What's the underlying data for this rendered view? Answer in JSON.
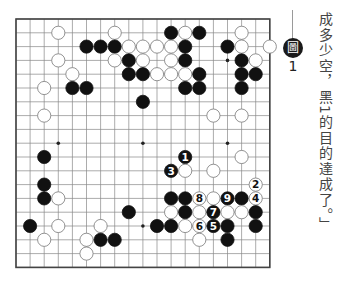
{
  "diagram": {
    "type": "go-board",
    "size": 19,
    "colors": {
      "black": "#111111",
      "white": "#ffffff",
      "line": "#888888",
      "frame": "#444444"
    },
    "star_points": [
      [
        3,
        3
      ],
      [
        9,
        3
      ],
      [
        15,
        3
      ],
      [
        3,
        9
      ],
      [
        9,
        9
      ],
      [
        15,
        9
      ],
      [
        3,
        15
      ],
      [
        9,
        15
      ],
      [
        15,
        15
      ]
    ],
    "stones": [
      {
        "c": 3,
        "r": 1,
        "color": "W"
      },
      {
        "c": 7,
        "r": 1,
        "color": "W"
      },
      {
        "c": 11,
        "r": 1,
        "color": "B"
      },
      {
        "c": 12,
        "r": 1,
        "color": "W"
      },
      {
        "c": 13,
        "r": 1,
        "color": "B"
      },
      {
        "c": 16,
        "r": 1,
        "color": "W"
      },
      {
        "c": 5,
        "r": 2,
        "color": "B"
      },
      {
        "c": 6,
        "r": 2,
        "color": "B"
      },
      {
        "c": 7,
        "r": 2,
        "color": "B"
      },
      {
        "c": 8,
        "r": 2,
        "color": "W"
      },
      {
        "c": 9,
        "r": 2,
        "color": "W"
      },
      {
        "c": 10,
        "r": 2,
        "color": "W"
      },
      {
        "c": 11,
        "r": 2,
        "color": "W"
      },
      {
        "c": 12,
        "r": 2,
        "color": "B"
      },
      {
        "c": 15,
        "r": 2,
        "color": "B"
      },
      {
        "c": 16,
        "r": 2,
        "color": "W"
      },
      {
        "c": 18,
        "r": 2,
        "color": "W"
      },
      {
        "c": 3,
        "r": 3,
        "color": "W"
      },
      {
        "c": 7,
        "r": 3,
        "color": "W"
      },
      {
        "c": 8,
        "r": 3,
        "color": "B"
      },
      {
        "c": 9,
        "r": 3,
        "color": "W"
      },
      {
        "c": 11,
        "r": 3,
        "color": "W"
      },
      {
        "c": 12,
        "r": 3,
        "color": "B"
      },
      {
        "c": 16,
        "r": 3,
        "color": "B"
      },
      {
        "c": 17,
        "r": 3,
        "color": "W"
      },
      {
        "c": 4,
        "r": 4,
        "color": "W"
      },
      {
        "c": 8,
        "r": 4,
        "color": "B"
      },
      {
        "c": 9,
        "r": 4,
        "color": "B"
      },
      {
        "c": 10,
        "r": 4,
        "color": "W"
      },
      {
        "c": 11,
        "r": 4,
        "color": "W"
      },
      {
        "c": 12,
        "r": 4,
        "color": "W"
      },
      {
        "c": 13,
        "r": 4,
        "color": "B"
      },
      {
        "c": 16,
        "r": 4,
        "color": "B"
      },
      {
        "c": 17,
        "r": 4,
        "color": "B"
      },
      {
        "c": 2,
        "r": 5,
        "color": "W"
      },
      {
        "c": 4,
        "r": 5,
        "color": "B"
      },
      {
        "c": 5,
        "r": 5,
        "color": "B"
      },
      {
        "c": 12,
        "r": 5,
        "color": "B"
      },
      {
        "c": 13,
        "r": 5,
        "color": "B"
      },
      {
        "c": 16,
        "r": 5,
        "color": "B"
      },
      {
        "c": 9,
        "r": 6,
        "color": "B"
      },
      {
        "c": 2,
        "r": 7,
        "color": "W"
      },
      {
        "c": 14,
        "r": 7,
        "color": "W"
      },
      {
        "c": 16,
        "r": 7,
        "color": "W"
      },
      {
        "c": 2,
        "r": 10,
        "color": "B"
      },
      {
        "c": 12,
        "r": 10,
        "color": "B",
        "label": "1"
      },
      {
        "c": 16,
        "r": 10,
        "color": "W"
      },
      {
        "c": 11,
        "r": 11,
        "color": "B",
        "label": "3"
      },
      {
        "c": 12,
        "r": 11,
        "color": "W"
      },
      {
        "c": 14,
        "r": 11,
        "color": "W"
      },
      {
        "c": 2,
        "r": 12,
        "color": "B"
      },
      {
        "c": 17,
        "r": 12,
        "color": "W",
        "label": "2"
      },
      {
        "c": 2,
        "r": 13,
        "color": "B"
      },
      {
        "c": 3,
        "r": 13,
        "color": "W"
      },
      {
        "c": 11,
        "r": 13,
        "color": "B"
      },
      {
        "c": 12,
        "r": 13,
        "color": "B"
      },
      {
        "c": 13,
        "r": 13,
        "color": "W",
        "label": "8"
      },
      {
        "c": 14,
        "r": 13,
        "color": "W"
      },
      {
        "c": 15,
        "r": 13,
        "color": "B",
        "label": "9"
      },
      {
        "c": 16,
        "r": 13,
        "color": "B"
      },
      {
        "c": 17,
        "r": 13,
        "color": "W",
        "label": "4"
      },
      {
        "c": 8,
        "r": 14,
        "color": "B"
      },
      {
        "c": 11,
        "r": 14,
        "color": "W"
      },
      {
        "c": 12,
        "r": 14,
        "color": "B"
      },
      {
        "c": 13,
        "r": 14,
        "color": "W"
      },
      {
        "c": 14,
        "r": 14,
        "color": "B",
        "label": "7"
      },
      {
        "c": 15,
        "r": 14,
        "color": "W"
      },
      {
        "c": 16,
        "r": 14,
        "color": "W"
      },
      {
        "c": 17,
        "r": 14,
        "color": "B"
      },
      {
        "c": 1,
        "r": 15,
        "color": "B"
      },
      {
        "c": 3,
        "r": 15,
        "color": "W"
      },
      {
        "c": 6,
        "r": 15,
        "color": "W"
      },
      {
        "c": 10,
        "r": 15,
        "color": "B"
      },
      {
        "c": 11,
        "r": 15,
        "color": "B"
      },
      {
        "c": 12,
        "r": 15,
        "color": "W"
      },
      {
        "c": 13,
        "r": 15,
        "color": "W",
        "label": "6"
      },
      {
        "c": 14,
        "r": 15,
        "color": "B",
        "label": "5"
      },
      {
        "c": 15,
        "r": 15,
        "color": "B"
      },
      {
        "c": 17,
        "r": 15,
        "color": "B"
      },
      {
        "c": 2,
        "r": 16,
        "color": "W"
      },
      {
        "c": 5,
        "r": 16,
        "color": "W"
      },
      {
        "c": 6,
        "r": 16,
        "color": "B"
      },
      {
        "c": 7,
        "r": 16,
        "color": "B"
      },
      {
        "c": 13,
        "r": 16,
        "color": "W"
      },
      {
        "c": 15,
        "r": 16,
        "color": "B"
      },
      {
        "c": 5,
        "r": 17,
        "color": "W"
      }
    ]
  },
  "caption": {
    "badge_glyph": "圖",
    "figure_number": "1"
  },
  "side_text": "成多少空，黑1的目的達成了。」"
}
